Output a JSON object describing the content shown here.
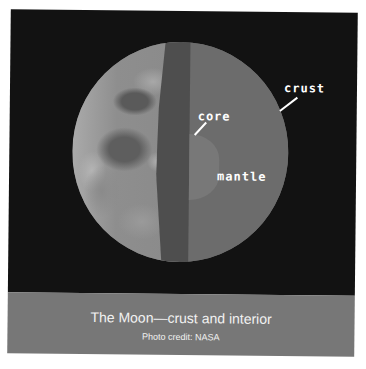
{
  "figure": {
    "labels": {
      "crust": "crust",
      "core": "core",
      "mantle": "mantle"
    },
    "caption": {
      "title": "The Moon—crust and interior",
      "credit": "Photo credit: NASA"
    },
    "colors": {
      "background": "#121212",
      "mantle": "#6c6c6c",
      "core": "#787878",
      "crust_band": "#4e4e4e",
      "caption_band": "#777777",
      "label_text": "#ffffff"
    }
  }
}
